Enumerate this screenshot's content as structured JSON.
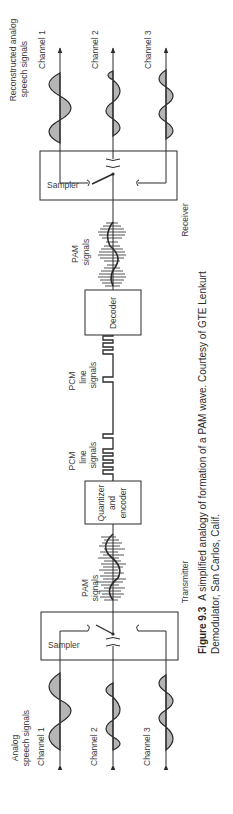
{
  "figure": {
    "number_label": "Figure 9.3",
    "caption_line1": "A simplified analogy of formation of a PAM wave. Courtesy of GTE Lenkurt",
    "caption_line2": "Demodulator, San Carlos, Calif."
  },
  "sections": {
    "transmitter": "Transmitter",
    "receiver": "Receiver"
  },
  "input": {
    "heading_line1": "Analog",
    "heading_line2": "speech signals",
    "channels": [
      "Channel 1",
      "Channel 2",
      "Channel 3"
    ]
  },
  "output": {
    "heading_line1": "Reconstructed analog",
    "heading_line2": "speech signals",
    "channels": [
      "Channel 1",
      "Channel 2",
      "Channel 3"
    ]
  },
  "blocks": {
    "tx_sampler": "Sampler",
    "quantizer_line1": "Quantizer",
    "quantizer_line2": "and",
    "quantizer_line3": "encoder",
    "decoder": "Decoder",
    "rx_sampler": "Sampler"
  },
  "signals": {
    "tx_pam_line1": "PAM",
    "tx_pam_line2": "signals",
    "pcm1_line1": "PCM",
    "pcm1_line2": "line",
    "pcm1_line3": "signals",
    "pcm2_line1": "PCM",
    "pcm2_line2": "line",
    "pcm2_line3": "signals",
    "rx_pam_line1": "PAM",
    "rx_pam_line2": "signals"
  },
  "colors": {
    "ink": "#2a2a2a",
    "paper": "#ffffff"
  },
  "orientation": "rotated 90deg counter-clockwise"
}
